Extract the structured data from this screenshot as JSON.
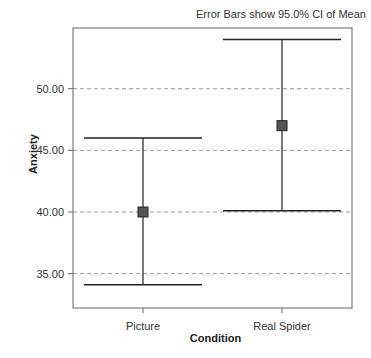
{
  "chart_data": {
    "type": "errorbar",
    "title": "",
    "annotation": "Error Bars show 95.0% CI of Mean",
    "xlabel": "Condition",
    "ylabel": "Anxiety",
    "categories": [
      "Picture",
      "Real Spider"
    ],
    "series": [
      {
        "name": "Mean",
        "values": [
          40.0,
          47.0
        ]
      },
      {
        "name": "CI Lower",
        "values": [
          34.1,
          40.1
        ]
      },
      {
        "name": "CI Upper",
        "values": [
          46.0,
          54.0
        ]
      }
    ],
    "yticks": [
      "35.00",
      "40.00",
      "45.00",
      "50.00"
    ],
    "ylim": [
      32.0,
      56.0
    ],
    "grid": "horizontal dashed",
    "legend": "none"
  },
  "labels": {
    "note": "Error Bars show 95.0% CI of Mean",
    "xlabel": "Condition",
    "ylabel": "Anxiety"
  },
  "colors": {
    "axis": "#666666",
    "grid": "#999999",
    "bar": "#222222",
    "marker_fill": "#555555"
  }
}
